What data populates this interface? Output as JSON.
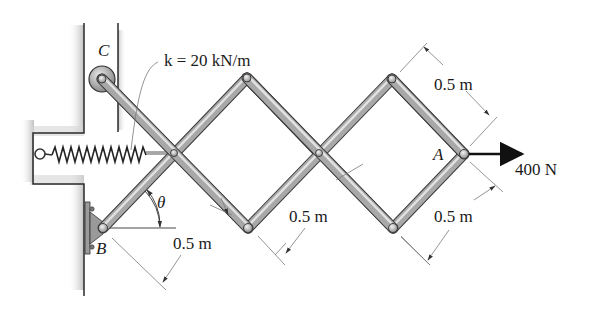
{
  "figure": {
    "type": "mechanism-free-body-diagram"
  },
  "labels": {
    "point_c": "C",
    "point_b": "B",
    "point_a": "A",
    "angle": "θ",
    "spring_constant": "k = 20 kN/m",
    "force": "400 N",
    "dim_top_right": "0.5 m",
    "dim_bottom_right": "0.5 m",
    "dim_bottom_mid": "0.5 m",
    "dim_bottom_left": "0.5 m"
  },
  "values": {
    "spring_k_value": 20,
    "spring_k_unit": "kN/m",
    "force_value": 400,
    "force_unit": "N",
    "member_length_value": 0.5,
    "member_length_unit": "m"
  },
  "colors": {
    "wall_line": "#2a2a2a",
    "wall_shade": "#c8c8c8",
    "link_fill": "#a8a8a8",
    "link_highlight": "#e0e0e0",
    "link_edge": "#3a3a3a",
    "dimension_line": "#7a7a7a",
    "arrow": "#111111"
  }
}
